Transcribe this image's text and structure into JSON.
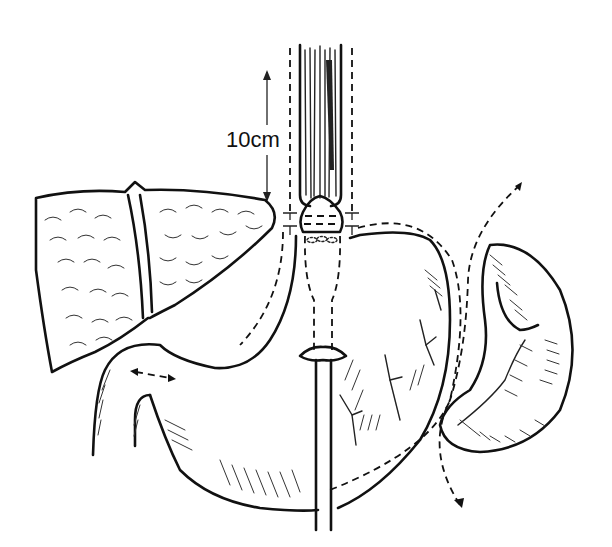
{
  "figure": {
    "type": "anatomical line illustration",
    "measurement_label": "10cm",
    "structures": [
      {
        "name": "esophagus",
        "icon": "esophagus-icon"
      },
      {
        "name": "liver",
        "icon": "liver-icon"
      },
      {
        "name": "stomach",
        "icon": "stomach-icon"
      },
      {
        "name": "spleen",
        "icon": "spleen-icon"
      },
      {
        "name": "dilator tube",
        "icon": "tube-icon"
      },
      {
        "name": "resection lines",
        "icon": "dashed-line-icon"
      }
    ],
    "colors": {
      "ink": "#111111",
      "background": "#ffffff"
    }
  }
}
